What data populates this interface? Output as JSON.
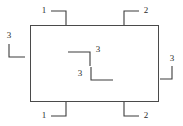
{
  "diagram": {
    "canvas": {
      "width": 183,
      "height": 126
    },
    "colors": {
      "background": "#ffffff",
      "outline_stroke": "#4a4a4a",
      "marker_stroke": "#3c3c3c",
      "label_text": "#2b2b2b"
    },
    "part": {
      "shape": "rectangle",
      "x": 30,
      "y": 25,
      "width": 129,
      "height": 77
    },
    "callouts": [
      {
        "id": "top-left",
        "label": "1",
        "label_x": 44,
        "label_y": 11,
        "label_anchor": "middle",
        "path": "M 51 11 L 66 11 L 66 25",
        "description": "leader from label 1 running right then down to the top edge"
      },
      {
        "id": "top-right",
        "label": "2",
        "label_x": 146,
        "label_y": 11,
        "label_anchor": "middle",
        "path": "M 124 25 L 124 11 L 139 11",
        "description": "leader from the top edge running up then right to label 2"
      },
      {
        "id": "left-side",
        "label": "3",
        "label_x": 9,
        "label_y": 36,
        "label_anchor": "middle",
        "path": "M 9 44 L 9 57 L 25 57",
        "description": "leader below label 3 running down then right toward the left edge"
      },
      {
        "id": "right-side",
        "label": "3",
        "label_x": 172,
        "label_y": 59,
        "label_anchor": "middle",
        "path": "M 172 66 L 172 79 L 160 79",
        "description": "leader below label 3 running down then left toward the right edge"
      },
      {
        "id": "interior-upper",
        "label": "3",
        "label_x": 98,
        "label_y": 50,
        "label_anchor": "middle",
        "path": "M 68 52 L 90 52 L 90 66",
        "description": "interior leader running right then down, label 3 at upper right"
      },
      {
        "id": "interior-lower",
        "label": "3",
        "label_x": 80,
        "label_y": 74,
        "label_anchor": "middle",
        "path": "M 91 67 L 91 80 L 113 80",
        "description": "interior leader running down then right, label 3 at left"
      },
      {
        "id": "bottom-left",
        "label": "1",
        "label_x": 44,
        "label_y": 116,
        "label_anchor": "middle",
        "path": "M 51 116 L 66 116 L 66 102",
        "description": "leader from label 1 running right then up to the bottom edge"
      },
      {
        "id": "bottom-right",
        "label": "2",
        "label_x": 146,
        "label_y": 116,
        "label_anchor": "middle",
        "path": "M 124 102 L 124 116 L 139 116",
        "description": "leader from the bottom edge running down then right to label 2"
      }
    ]
  }
}
